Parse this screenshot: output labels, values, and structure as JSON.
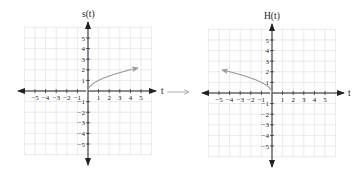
{
  "chart_data": [
    {
      "type": "line",
      "title": "s(t)",
      "xlabel": "t",
      "ylabel": "s(t)",
      "xlim": [
        -6,
        6
      ],
      "ylim": [
        -6,
        6
      ],
      "grid": true,
      "x_ticks": [
        -5,
        -4,
        -3,
        -2,
        -1,
        1,
        2,
        3,
        4,
        5
      ],
      "y_ticks": [
        -5,
        -4,
        -3,
        -2,
        -1,
        1,
        2,
        3,
        4,
        5
      ],
      "series": [
        {
          "name": "s(t) = sqrt(t)",
          "x": [
            0,
            0.25,
            1,
            2,
            3,
            4,
            4.7
          ],
          "y": [
            0,
            0.5,
            1,
            1.41,
            1.73,
            2,
            2.17
          ],
          "color": "#9a9a9a",
          "arrow_end": true
        }
      ]
    },
    {
      "type": "line",
      "title": "H(t)",
      "xlabel": "t",
      "ylabel": "H(t)",
      "xlim": [
        -6,
        6
      ],
      "ylim": [
        -6,
        6
      ],
      "grid": true,
      "x_ticks": [
        -5,
        -4,
        -3,
        -2,
        -1,
        1,
        2,
        3,
        4,
        5
      ],
      "y_ticks": [
        -5,
        -4,
        -3,
        -2,
        -1,
        1,
        2,
        3,
        4,
        5
      ],
      "series": [
        {
          "name": "H(t) = sqrt(-t)",
          "x": [
            0,
            -0.25,
            -1,
            -2,
            -3,
            -4,
            -4.7
          ],
          "y": [
            0,
            0.5,
            1,
            1.41,
            1.73,
            2,
            2.17
          ],
          "color": "#9a9a9a",
          "arrow_end": true
        }
      ]
    }
  ],
  "labels": {
    "left_y_title": "s(t)",
    "left_x_title": "t",
    "right_y_title": "H(t)",
    "right_x_title": "t",
    "x_ticks": [
      "−5",
      "−4",
      "−3",
      "−2",
      "−1",
      "1",
      "2",
      "3",
      "4",
      "5"
    ],
    "y_ticks_pos": [
      "5",
      "4",
      "3",
      "2",
      "1"
    ],
    "y_ticks_neg": [
      "−1",
      "−2",
      "−3",
      "−4",
      "−5"
    ]
  },
  "transition_arrow": {
    "color": "#9a9a9a"
  }
}
